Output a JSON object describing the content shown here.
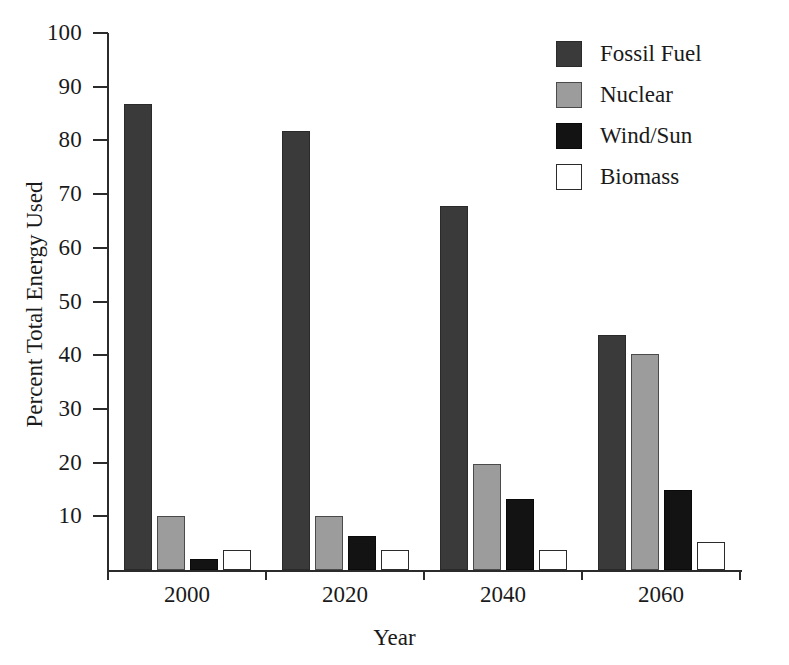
{
  "chart_data": {
    "type": "bar",
    "title": "",
    "subtitle": "",
    "xlabel": "Year",
    "ylabel": "Percent Total Energy Used",
    "categories": [
      "2000",
      "2020",
      "2040",
      "2060"
    ],
    "series": [
      {
        "name": "Fossil Fuel",
        "color": "#3a3a3a",
        "values": [
          86.8,
          81.8,
          67.8,
          43.8
        ]
      },
      {
        "name": "Nuclear",
        "color": "#9c9c9c",
        "values": [
          10.0,
          10.0,
          19.8,
          40.3
        ]
      },
      {
        "name": "Wind/Sun",
        "color": "#131313",
        "values": [
          2.0,
          6.4,
          13.2,
          14.9
        ]
      },
      {
        "name": "Biomass",
        "color": "#ffffff",
        "values": [
          3.8,
          3.8,
          3.8,
          5.2
        ]
      }
    ],
    "ylim": [
      0,
      100
    ],
    "y_ticks": [
      10,
      20,
      30,
      40,
      50,
      60,
      70,
      80,
      90,
      100
    ],
    "y_tick_labels": [
      "10",
      "20",
      "30",
      "40",
      "50",
      "60",
      "70",
      "80",
      "90",
      "100"
    ],
    "x_tick_labels": [
      "2000",
      "2020",
      "2040",
      "2060"
    ],
    "grid": false,
    "legend_position": "top-right",
    "legend_entries": [
      "Fossil Fuel",
      "Nuclear",
      "Wind/Sun",
      "Biomass"
    ],
    "axis_color": "#2b2b2b",
    "background_color": "#ffffff"
  }
}
